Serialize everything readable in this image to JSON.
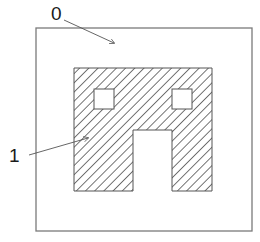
{
  "diagram": {
    "type": "patent-style figure",
    "colors": {
      "background": "#ffffff",
      "outer_border": "#7a7a7a",
      "shape_outline": "#555555",
      "hatch": "#2a2a2a",
      "leader_line": "#555555",
      "label": "#1a1a1a"
    },
    "outer_region": {
      "x": 36,
      "y": 28,
      "width": 216,
      "height": 203
    },
    "hatched_region": {
      "outline_points": "74,68 212,68 212,191 172,191 172,130 133,130 133,191 74,191",
      "hatch_angle_deg": 45,
      "hatch_spacing_px": 6.5
    },
    "openings": [
      {
        "name": "left-window",
        "x": 94,
        "y": 89,
        "width": 20,
        "height": 20
      },
      {
        "name": "right-window",
        "x": 172,
        "y": 89,
        "width": 20,
        "height": 20
      }
    ],
    "labels": [
      {
        "id": "label-0",
        "text": "0",
        "text_x": 51,
        "text_y": 20,
        "leader": {
          "x1": 64,
          "y1": 20,
          "x2": 114,
          "y2": 43
        }
      },
      {
        "id": "label-1",
        "text": "1",
        "text_x": 9,
        "text_y": 162,
        "leader": {
          "x1": 29,
          "y1": 155,
          "x2": 88,
          "y2": 138
        }
      }
    ]
  }
}
